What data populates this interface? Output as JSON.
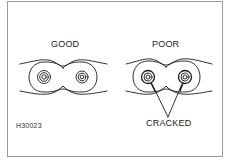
{
  "figure": {
    "id_code": "H30023",
    "panels": [
      {
        "label": "GOOD",
        "condition": "good"
      },
      {
        "label": "POOR",
        "condition": "poor"
      }
    ],
    "callout": {
      "label": "CRACKED"
    },
    "colors": {
      "line": "#1a1a1a",
      "border": "#9a9a9a",
      "background": "#ffffff"
    }
  }
}
